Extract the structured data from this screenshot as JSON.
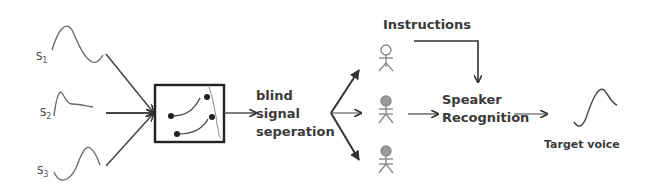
{
  "diagram": {
    "sources": [
      {
        "label": "S",
        "sub": "1"
      },
      {
        "label": "S",
        "sub": "2"
      },
      {
        "label": "S",
        "sub": "3"
      }
    ],
    "mixer_box": {
      "icon": "switch-mixer-icon"
    },
    "bss_label": [
      "blind",
      "signal",
      "seperation"
    ],
    "speakers": [
      {
        "name": "speaker-1",
        "head": "hollow"
      },
      {
        "name": "speaker-2",
        "head": "filled"
      },
      {
        "name": "speaker-3",
        "head": "filled"
      }
    ],
    "instructions_label": "Instructions",
    "recognition_label": [
      "Speaker",
      "Recognition"
    ],
    "target_label": "Target voice",
    "colors": {
      "line": "#3a3a3a",
      "text": "#3a3a3a",
      "person_stroke": "#8a8a8a",
      "person_fill": "#9a9a9a",
      "background": "#ffffff"
    }
  }
}
